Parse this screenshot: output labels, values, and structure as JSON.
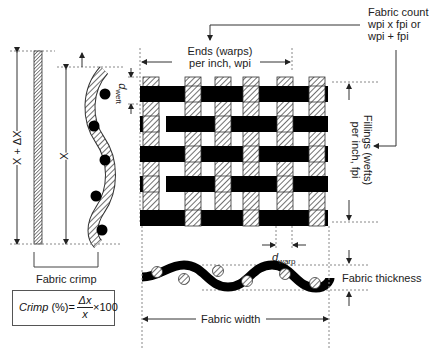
{
  "diagram": {
    "title_labels": {
      "fabric_count_line1": "Fabric count",
      "fabric_count_line2": "wpi x fpi  or",
      "fabric_count_line3": "wpi + fpi",
      "ends_line1": "Ends (warps)",
      "ends_line2": "per inch, wpi",
      "fillings_line1": "Fillings (wefts)",
      "fillings_line2": "per inch, fpi",
      "d_weft": "d",
      "d_weft_sub": "weft",
      "d_warp": "d",
      "d_warp_sub": "warp",
      "x_plus_dx": "X + ΔX",
      "x": "X",
      "fabric_crimp": "Fabric crimp",
      "fabric_thickness": "Fabric thickness",
      "fabric_width": "Fabric width"
    },
    "formula": {
      "lhs": "Crimp",
      "unit": " (%)=",
      "numerator": "Δx",
      "denominator": "x",
      "multiplier": "×100"
    },
    "colors": {
      "yarn_fill": "#000000",
      "hatch": "#333333",
      "guide": "#666666"
    }
  }
}
